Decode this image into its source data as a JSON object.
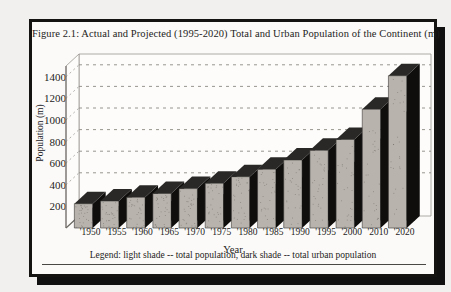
{
  "figure": {
    "title": "Figure 2.1: Actual and Projected (1995-2020) Total and Urban Population of the Continent (m)",
    "legend": "Legend:  light shade -- total population,  dark shade -- total urban population"
  },
  "chart_data": {
    "type": "bar",
    "title": "Figure 2.1: Actual and Projected (1995-2020) Total and Urban Population of the Continent (m)",
    "xlabel": "Year",
    "ylabel": "Population (m)",
    "categories": [
      "'1950",
      "'1955",
      "'1960",
      "'1965",
      "'1970",
      "'1975",
      "'1980",
      "'1985",
      "'1990",
      "'1995",
      "'2000",
      "'2010",
      "'2020"
    ],
    "yticks": [
      200,
      400,
      600,
      800,
      1000,
      1200,
      1400
    ],
    "ylim": [
      0,
      1500
    ],
    "grid": true,
    "legend_position": "below-axes",
    "series": [
      {
        "name": "total population",
        "shade": "light",
        "color": "#b8b4ad",
        "values": [
          225,
          250,
          285,
          320,
          365,
          415,
          475,
          545,
          630,
          720,
          820,
          1100,
          1410
        ]
      },
      {
        "name": "total urban population",
        "shade": "dark",
        "color": "#121110",
        "values": [
          120,
          135,
          155,
          180,
          210,
          245,
          290,
          340,
          400,
          465,
          545,
          760,
          1010
        ]
      }
    ]
  },
  "colors": {
    "frame": "#141312",
    "paper": "#fbfaf8",
    "ink": "#1d1c1b",
    "bar_light": "#b8b4ad",
    "bar_dark": "#121110",
    "grid": "#8d8a85"
  }
}
